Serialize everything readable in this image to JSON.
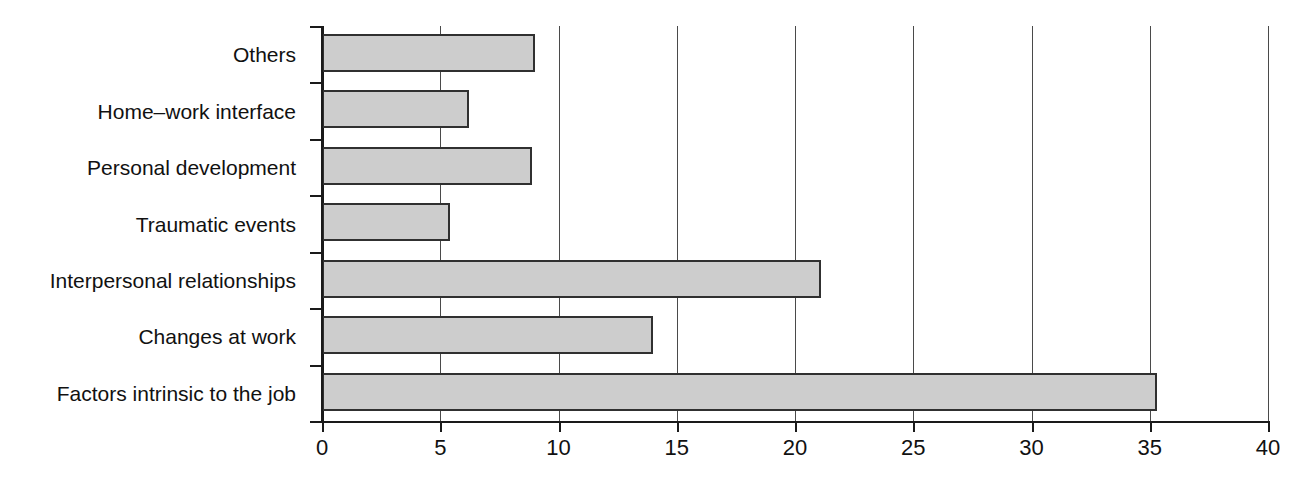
{
  "chart_data": {
    "type": "bar",
    "orientation": "horizontal",
    "title": "",
    "subtitle": "",
    "xlabel": "",
    "ylabel": "",
    "xlim": [
      0,
      40
    ],
    "grid": true,
    "legend": "none",
    "categories": [
      "Factors intrinsic to the job",
      "Changes at work",
      "Interpersonal relationships",
      "Traumatic events",
      "Personal development",
      "Home–work interface",
      "Others"
    ],
    "values": [
      35.3,
      14.0,
      21.1,
      5.4,
      8.9,
      6.2,
      9.0
    ],
    "xticks": [
      0,
      5,
      10,
      15,
      20,
      25,
      30,
      35,
      40
    ],
    "xtick_labels": [
      "0",
      "5",
      "10",
      "15",
      "20",
      "25",
      "30",
      "35",
      "40"
    ],
    "bar_fill_color": "#cdcdcd",
    "bar_edge_color": "#303030",
    "axis_color": "#1a1a1a",
    "grid_color": "#4a4a4a",
    "background_color": "#ffffff"
  },
  "display_order_top_to_bottom": [
    {
      "label": "Others",
      "value": 9.0
    },
    {
      "label": "Home–work interface",
      "value": 6.2
    },
    {
      "label": "Personal development",
      "value": 8.9
    },
    {
      "label": "Traumatic events",
      "value": 5.4
    },
    {
      "label": "Interpersonal relationships",
      "value": 21.1
    },
    {
      "label": "Changes at work",
      "value": 14.0
    },
    {
      "label": "Factors intrinsic to the job",
      "value": 35.3
    }
  ]
}
